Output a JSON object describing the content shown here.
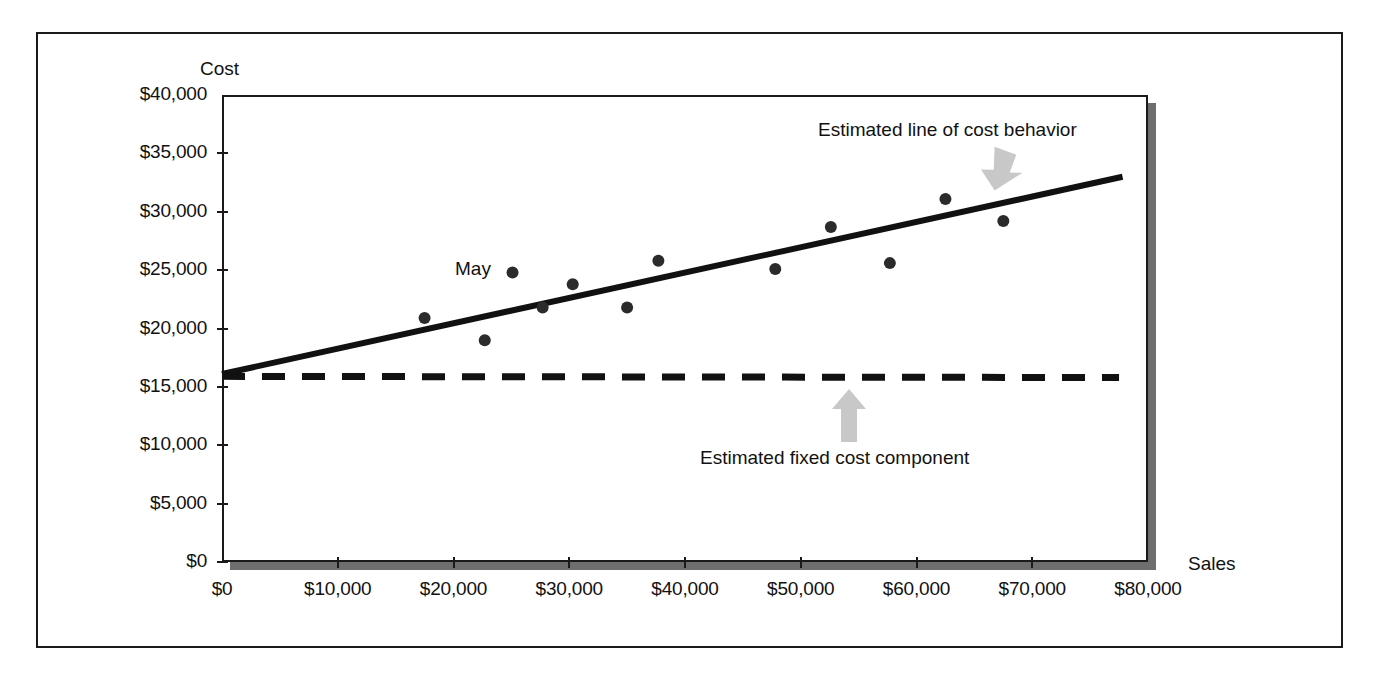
{
  "figure": {
    "axis_titles": {
      "y": "Cost",
      "x": "Sales"
    },
    "annotations": {
      "trend_line": "Estimated line of cost behavior",
      "fixed_cost": "Estimated fixed cost component",
      "point_label": "May"
    },
    "icons": {
      "arrow_to_trend_line": "arrow-down-right-icon",
      "arrow_to_fixed_line": "arrow-up-icon"
    },
    "colors": {
      "ink": "#111111",
      "plot_shadow": "#6e6e6e",
      "arrow_fill": "#c8c8c8",
      "point_fill": "#2b2b2b"
    }
  },
  "chart_data": {
    "type": "scatter",
    "title": "",
    "xlabel": "Sales",
    "ylabel": "Cost",
    "xlim": [
      0,
      80000
    ],
    "ylim": [
      0,
      40000
    ],
    "grid": false,
    "legend": false,
    "x_ticks": [
      0,
      10000,
      20000,
      30000,
      40000,
      50000,
      60000,
      70000,
      80000
    ],
    "x_tick_labels": [
      "$0",
      "$10,000",
      "$20,000",
      "$30,000",
      "$40,000",
      "$50,000",
      "$60,000",
      "$70,000",
      "$80,000"
    ],
    "y_ticks": [
      0,
      5000,
      10000,
      15000,
      20000,
      25000,
      30000,
      35000,
      40000
    ],
    "y_tick_labels": [
      "$0",
      "$5,000",
      "$10,000",
      "$15,000",
      "$20,000",
      "$25,000",
      "$30,000",
      "$35,000",
      "$40,000"
    ],
    "series": [
      {
        "name": "Monthly observations",
        "type": "scatter",
        "marker": "circle",
        "color": "#2b2b2b",
        "points": [
          {
            "x": 17500,
            "y": 20900,
            "label": ""
          },
          {
            "x": 22700,
            "y": 19000,
            "label": ""
          },
          {
            "x": 25100,
            "y": 24800,
            "label": "May"
          },
          {
            "x": 27700,
            "y": 21800,
            "label": ""
          },
          {
            "x": 30300,
            "y": 23800,
            "label": ""
          },
          {
            "x": 35000,
            "y": 21800,
            "label": ""
          },
          {
            "x": 37700,
            "y": 25800,
            "label": ""
          },
          {
            "x": 47800,
            "y": 25100,
            "label": ""
          },
          {
            "x": 52600,
            "y": 28700,
            "label": ""
          },
          {
            "x": 57700,
            "y": 25600,
            "label": ""
          },
          {
            "x": 62500,
            "y": 31100,
            "label": ""
          },
          {
            "x": 67500,
            "y": 29200,
            "label": ""
          }
        ]
      },
      {
        "name": "Estimated line of cost behavior",
        "type": "line",
        "style": "solid",
        "color": "#111111",
        "x": [
          0,
          77800
        ],
        "y": [
          16100,
          33000
        ]
      },
      {
        "name": "Estimated fixed cost component",
        "type": "line",
        "style": "dashed",
        "color": "#111111",
        "x": [
          0,
          77500
        ],
        "y": [
          15900,
          15800
        ]
      }
    ]
  }
}
